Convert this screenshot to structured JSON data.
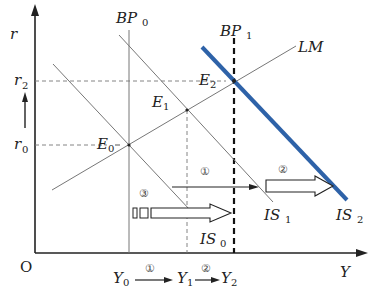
{
  "diagram": {
    "type": "IS-LM-BP diagram",
    "axes": {
      "y_label": "r",
      "x_label": "Y",
      "origin_label": "O",
      "y_ticks": [
        {
          "base": "r",
          "sub": "2"
        },
        {
          "base": "r",
          "sub": "0"
        }
      ],
      "x_ticks": [
        {
          "base": "Y",
          "sub": "0"
        },
        {
          "base": "Y",
          "sub": "1"
        },
        {
          "base": "Y",
          "sub": "2"
        }
      ]
    },
    "curves": {
      "bp0": {
        "base": "BP",
        "sub": "0"
      },
      "bp1": {
        "base": "BP",
        "sub": "1"
      },
      "lm": {
        "base": "LM"
      },
      "is0": {
        "base": "IS",
        "sub": "0"
      },
      "is1": {
        "base": "IS",
        "sub": "1"
      },
      "is2": {
        "base": "IS",
        "sub": "2"
      }
    },
    "points": {
      "e0": {
        "base": "E",
        "sub": "0"
      },
      "e1": {
        "base": "E",
        "sub": "1"
      },
      "e2": {
        "base": "E",
        "sub": "2"
      }
    },
    "steps": {
      "step1": "①",
      "step2": "②",
      "step3": "③"
    },
    "colors": {
      "is2": "#2e62a8",
      "lines": "#777777",
      "axis": "#222222"
    }
  }
}
